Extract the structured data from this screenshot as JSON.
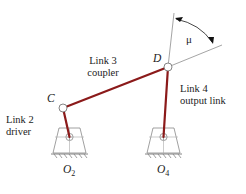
{
  "diagram": {
    "colors": {
      "link": "#8b1a1a",
      "construction": "#9a9a9a",
      "ground": "#777777",
      "text": "#222222",
      "background": "#ffffff"
    },
    "joints": {
      "C": "C",
      "D": "D",
      "O2": {
        "letter": "O",
        "subscript": "2"
      },
      "O4": {
        "letter": "O",
        "subscript": "4"
      }
    },
    "links": {
      "link2": {
        "name": "Link 2",
        "role": "driver"
      },
      "link3": {
        "name": "Link 3",
        "role": "coupler"
      },
      "link4": {
        "name": "Link 4",
        "role": "output link"
      }
    },
    "angle": {
      "symbol": "μ"
    }
  }
}
